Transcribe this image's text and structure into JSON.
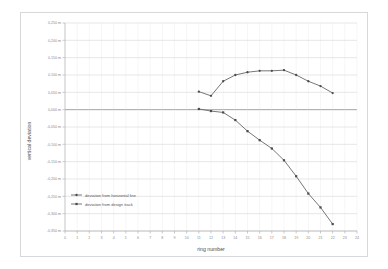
{
  "chart_data": {
    "type": "line",
    "title": "",
    "xlabel": "ring number",
    "ylabel": "vertical deviation",
    "xlim": [
      0,
      24
    ],
    "ylim": [
      -0.35,
      0.25
    ],
    "grid": true,
    "legend_position": "bottom-left",
    "x_ticks": [
      0,
      1,
      2,
      3,
      4,
      5,
      6,
      7,
      8,
      9,
      10,
      11,
      12,
      13,
      14,
      15,
      16,
      17,
      18,
      19,
      20,
      21,
      22,
      23,
      24
    ],
    "x_tick_labels": [
      "0",
      "1",
      "2",
      "3",
      "4",
      "5",
      "6",
      "7",
      "8",
      "9",
      "10",
      "11",
      "12",
      "13",
      "14",
      "15",
      "16",
      "17",
      "18",
      "19",
      "20",
      "21",
      "22",
      "23",
      "24"
    ],
    "y_ticks": [
      0.25,
      0.2,
      0.15,
      0.1,
      0.05,
      0.0,
      -0.05,
      -0.1,
      -0.15,
      -0.2,
      -0.25,
      -0.3,
      -0.35
    ],
    "y_tick_labels": [
      "0,250 m",
      "0,200 m",
      "0,150 m",
      "0,100 m",
      "0,050 m",
      "0,000 m",
      "-0,050 m",
      "-0,100 m",
      "-0,150 m",
      "-0,200 m",
      "-0,250 m",
      "-0,300 m",
      "-0,350 m"
    ],
    "series": [
      {
        "name": "deviation from horizontal line",
        "x": [
          11,
          12,
          13,
          14,
          15,
          16,
          17,
          18,
          19,
          20,
          21,
          22
        ],
        "values": [
          0.052,
          0.04,
          0.082,
          0.1,
          0.108,
          0.112,
          0.112,
          0.114,
          0.1,
          0.082,
          0.068,
          0.048
        ]
      },
      {
        "name": "deviation from design track",
        "x": [
          11,
          12,
          13,
          14,
          15,
          16,
          17,
          18,
          19,
          20,
          21,
          22
        ],
        "values": [
          0.002,
          -0.004,
          -0.008,
          -0.03,
          -0.062,
          -0.088,
          -0.112,
          -0.146,
          -0.192,
          -0.242,
          -0.282,
          -0.33
        ]
      }
    ]
  },
  "legend": {
    "items": [
      {
        "label": "deviation from horizontal line"
      },
      {
        "label": "deviation from design track"
      }
    ]
  },
  "colors": {
    "series_line": "#5f5f5f",
    "marker": "#4a4a4a",
    "grid": "#c9c9c9",
    "zero_axis": "#7d7d7d",
    "tick_text": "#8a8a8a",
    "title_text": "#4a4a4a",
    "frame": "#d8d8d8"
  }
}
